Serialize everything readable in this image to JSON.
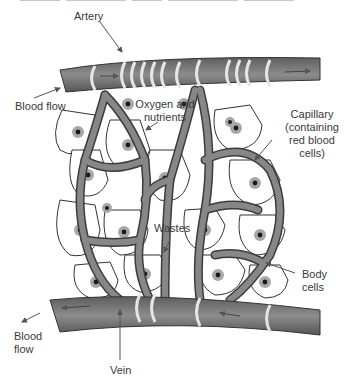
{
  "diagram": {
    "labels": {
      "artery": "Artery",
      "blood_flow_top": "Blood flow",
      "oxygen_nutrients_1": "Oxygen and",
      "oxygen_nutrients_2": "nutrients",
      "capillary_1": "Capillary",
      "capillary_2": "(containing",
      "capillary_3": "red blood",
      "capillary_4": "cells)",
      "wastes": "Wastes",
      "body_cells_1": "Body",
      "body_cells_2": "cells",
      "blood_flow_bottom_1": "Blood",
      "blood_flow_bottom_2": "flow",
      "vein": "Vein"
    },
    "colors": {
      "vessel_fill": "#7a7a7a",
      "vessel_dark": "#4a4a4a",
      "vessel_band": "#e6e6e6",
      "cell_fill": "#ffffff",
      "nucleus_halo": "#a8a8a8",
      "nucleus": "#1a1a1a",
      "label_text": "#3a3a3a",
      "pointer": "#555555"
    }
  }
}
